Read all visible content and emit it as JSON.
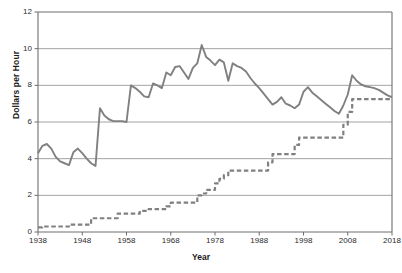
{
  "chart_data": {
    "type": "line",
    "title": "",
    "xlabel": "Year",
    "ylabel": "Dollars per Hour",
    "xlim": [
      1938,
      2018
    ],
    "ylim": [
      0,
      12
    ],
    "xticks": [
      1938,
      1948,
      1958,
      1968,
      1978,
      1988,
      1998,
      2008,
      2018
    ],
    "yticks": [
      0,
      2,
      4,
      6,
      8,
      10,
      12
    ],
    "grid": "horizontal",
    "legend_position": "none",
    "colors": {
      "line": "#808080",
      "grid": "#8c8c8c",
      "axis": "#6e6e6e",
      "text": "#1a1a1a"
    },
    "series": [
      {
        "name": "Real (inflation-adjusted) minimum wage",
        "style": "solid",
        "x": [
          1938,
          1939,
          1940,
          1941,
          1942,
          1943,
          1944,
          1945,
          1946,
          1947,
          1948,
          1949,
          1950,
          1951,
          1952,
          1953,
          1954,
          1955,
          1956,
          1957,
          1958,
          1959,
          1960,
          1961,
          1962,
          1963,
          1964,
          1965,
          1966,
          1967,
          1968,
          1969,
          1970,
          1971,
          1972,
          1973,
          1974,
          1975,
          1976,
          1977,
          1978,
          1979,
          1980,
          1981,
          1982,
          1983,
          1984,
          1985,
          1986,
          1987,
          1988,
          1989,
          1990,
          1991,
          1992,
          1993,
          1994,
          1995,
          1996,
          1997,
          1998,
          1999,
          2000,
          2001,
          2002,
          2003,
          2004,
          2005,
          2006,
          2007,
          2008,
          2009,
          2010,
          2011,
          2012,
          2013,
          2014,
          2015,
          2016,
          2017,
          2018
        ],
        "y": [
          4.3,
          4.7,
          4.8,
          4.55,
          4.1,
          3.85,
          3.75,
          3.65,
          4.35,
          4.55,
          4.3,
          4.0,
          3.75,
          3.6,
          6.75,
          6.35,
          6.15,
          6.05,
          6.05,
          6.05,
          6.0,
          8.0,
          7.85,
          7.65,
          7.4,
          7.35,
          8.1,
          8.0,
          7.85,
          8.7,
          8.55,
          9.0,
          9.05,
          8.7,
          8.35,
          8.95,
          9.2,
          10.2,
          9.55,
          9.35,
          9.1,
          9.4,
          9.25,
          8.25,
          9.2,
          9.05,
          8.95,
          8.75,
          8.4,
          8.1,
          7.85,
          7.55,
          7.25,
          6.95,
          7.1,
          7.35,
          7.0,
          6.9,
          6.75,
          6.95,
          7.65,
          7.9,
          7.6,
          7.4,
          7.2,
          7.0,
          6.8,
          6.6,
          6.45,
          6.9,
          7.5,
          8.55,
          8.25,
          8.05,
          7.95,
          7.9,
          7.85,
          7.75,
          7.6,
          7.45,
          7.35
        ]
      },
      {
        "name": "Nominal minimum wage",
        "style": "dashed",
        "x": [
          1938,
          1939,
          1940,
          1941,
          1942,
          1943,
          1944,
          1945,
          1946,
          1947,
          1948,
          1949,
          1950,
          1951,
          1952,
          1953,
          1954,
          1955,
          1956,
          1957,
          1958,
          1959,
          1960,
          1961,
          1962,
          1963,
          1964,
          1965,
          1966,
          1967,
          1968,
          1969,
          1970,
          1971,
          1972,
          1973,
          1974,
          1975,
          1976,
          1977,
          1978,
          1979,
          1980,
          1981,
          1982,
          1983,
          1984,
          1985,
          1986,
          1987,
          1988,
          1989,
          1990,
          1991,
          1992,
          1993,
          1994,
          1995,
          1996,
          1997,
          1998,
          1999,
          2000,
          2001,
          2002,
          2003,
          2004,
          2005,
          2006,
          2007,
          2008,
          2009,
          2010,
          2011,
          2012,
          2013,
          2014,
          2015,
          2016,
          2017,
          2018
        ],
        "y": [
          0.25,
          0.3,
          0.3,
          0.3,
          0.3,
          0.3,
          0.3,
          0.4,
          0.4,
          0.4,
          0.4,
          0.4,
          0.75,
          0.75,
          0.75,
          0.75,
          0.75,
          0.75,
          1.0,
          1.0,
          1.0,
          1.0,
          1.0,
          1.15,
          1.15,
          1.25,
          1.25,
          1.25,
          1.25,
          1.4,
          1.6,
          1.6,
          1.6,
          1.6,
          1.6,
          1.6,
          2.0,
          2.1,
          2.3,
          2.3,
          2.65,
          2.9,
          3.1,
          3.35,
          3.35,
          3.35,
          3.35,
          3.35,
          3.35,
          3.35,
          3.35,
          3.35,
          3.8,
          4.25,
          4.25,
          4.25,
          4.25,
          4.25,
          4.75,
          5.15,
          5.15,
          5.15,
          5.15,
          5.15,
          5.15,
          5.15,
          5.15,
          5.15,
          5.15,
          5.85,
          6.55,
          7.25,
          7.25,
          7.25,
          7.25,
          7.25,
          7.25,
          7.25,
          7.25,
          7.25,
          7.25
        ]
      }
    ]
  },
  "axis": {
    "ylabel": "Dollars per Hour",
    "xlabel": "Year",
    "xtick_labels": [
      "1938",
      "1948",
      "1958",
      "1968",
      "1978",
      "1988",
      "1998",
      "2008",
      "2018"
    ],
    "ytick_labels": [
      "0",
      "2",
      "4",
      "6",
      "8",
      "10",
      "12"
    ]
  }
}
